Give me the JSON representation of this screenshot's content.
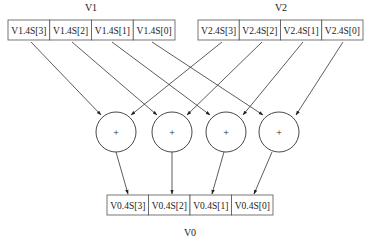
{
  "diagram": {
    "type": "simd-vector-add",
    "v1": {
      "label": "V1",
      "cells": [
        "V1.4S[3]",
        "V1.4S[2]",
        "V1.4S[1]",
        "V1.4S[0]"
      ]
    },
    "v2": {
      "label": "V2",
      "cells": [
        "V2.4S[3]",
        "V2.4S[2]",
        "V2.4S[1]",
        "V2.4S[0]"
      ]
    },
    "adders": [
      {
        "symbol": "+"
      },
      {
        "symbol": "+"
      },
      {
        "symbol": "+"
      },
      {
        "symbol": "+"
      }
    ],
    "v0": {
      "label": "V0",
      "cells": [
        "V0.4S[3]",
        "V0.4S[2]",
        "V0.4S[1]",
        "V0.4S[0]"
      ]
    },
    "edges": [
      {
        "from": "V1.4S[3]",
        "to": "adder-0"
      },
      {
        "from": "V1.4S[2]",
        "to": "adder-1"
      },
      {
        "from": "V1.4S[1]",
        "to": "adder-2"
      },
      {
        "from": "V1.4S[0]",
        "to": "adder-3"
      },
      {
        "from": "V2.4S[3]",
        "to": "adder-0"
      },
      {
        "from": "V2.4S[2]",
        "to": "adder-1"
      },
      {
        "from": "V2.4S[1]",
        "to": "adder-2"
      },
      {
        "from": "V2.4S[0]",
        "to": "adder-3"
      },
      {
        "from": "adder-0",
        "to": "V0.4S[3]"
      },
      {
        "from": "adder-1",
        "to": "V0.4S[2]"
      },
      {
        "from": "adder-2",
        "to": "V0.4S[1]"
      },
      {
        "from": "adder-3",
        "to": "V0.4S[0]"
      }
    ]
  }
}
